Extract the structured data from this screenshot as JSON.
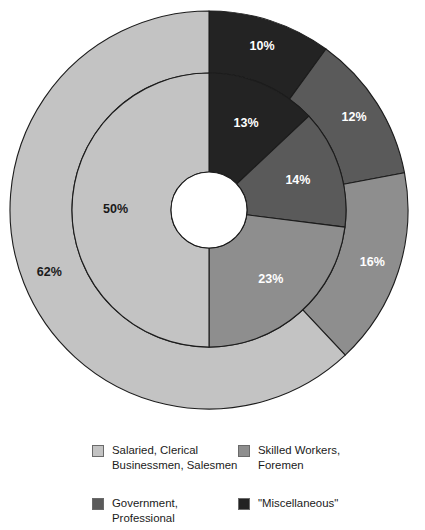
{
  "chart_data": {
    "type": "pie",
    "variant": "nested-donut",
    "title": "",
    "subtitle": "",
    "xlabel": "",
    "ylabel": "",
    "grid": false,
    "legend_position": "bottom",
    "start_angle_deg": 0,
    "direction": "clockwise",
    "categories": [
      "Salaried, Clerical Businessmen, Salesmen",
      "Skilled Workers, Foremen",
      "Government, Professional",
      "\"Miscellaneous\""
    ],
    "colors": [
      "#c3c3c3",
      "#8e8e8e",
      "#5a5a5a",
      "#232323"
    ],
    "rings": [
      {
        "name": "inner-ring",
        "inner_radius": 38,
        "outer_radius": 137,
        "slices": [
          {
            "category": "\"Miscellaneous\"",
            "value": 13,
            "label": "13%",
            "color": "#232323",
            "label_color": "light"
          },
          {
            "category": "Government, Professional",
            "value": 14,
            "label": "14%",
            "color": "#5a5a5a",
            "label_color": "light"
          },
          {
            "category": "Skilled Workers, Foremen",
            "value": 23,
            "label": "23%",
            "color": "#8e8e8e",
            "label_color": "light"
          },
          {
            "category": "Salaried, Clerical Businessmen, Salesmen",
            "value": 50,
            "label": "50%",
            "color": "#c3c3c3",
            "label_color": "dark"
          }
        ]
      },
      {
        "name": "outer-ring",
        "inner_radius": 137,
        "outer_radius": 199,
        "slices": [
          {
            "category": "\"Miscellaneous\"",
            "value": 10,
            "label": "10%",
            "color": "#232323",
            "label_color": "light"
          },
          {
            "category": "Government, Professional",
            "value": 12,
            "label": "12%",
            "color": "#5a5a5a",
            "label_color": "light"
          },
          {
            "category": "Skilled Workers, Foremen",
            "value": 16,
            "label": "16%",
            "color": "#8e8e8e",
            "label_color": "light"
          },
          {
            "category": "Salaried, Clerical Businessmen, Salesmen",
            "value": 62,
            "label": "62%",
            "color": "#c3c3c3",
            "label_color": "dark"
          }
        ]
      }
    ],
    "series": [
      {
        "name": "inner-ring",
        "values": [
          13,
          14,
          23,
          50
        ]
      },
      {
        "name": "outer-ring",
        "values": [
          10,
          12,
          16,
          62
        ]
      }
    ]
  },
  "legend": {
    "items": [
      {
        "label": "Salaried, Clerical\nBusinessmen, Salesmen",
        "color": "#c3c3c3",
        "name": "legend-item-salaried"
      },
      {
        "label": "Skilled Workers,\nForemen",
        "color": "#8e8e8e",
        "name": "legend-item-skilled-workers"
      },
      {
        "label": "Government,\nProfessional",
        "color": "#5a5a5a",
        "name": "legend-item-government"
      },
      {
        "label": "\"Miscellaneous\"",
        "color": "#232323",
        "name": "legend-item-miscellaneous"
      }
    ]
  }
}
